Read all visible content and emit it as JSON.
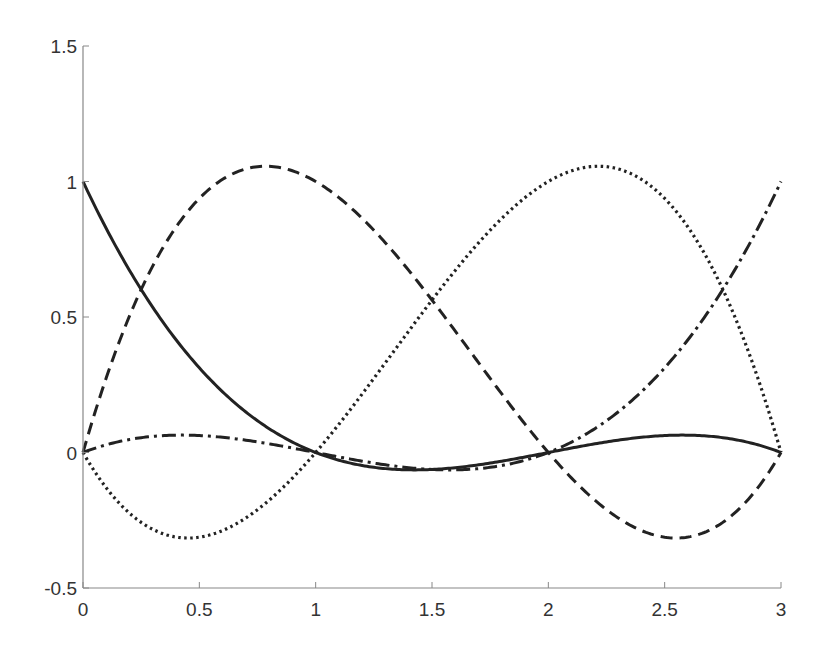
{
  "chart_data": {
    "type": "line",
    "title": "",
    "xlabel": "",
    "ylabel": "",
    "xlim": [
      0,
      3
    ],
    "ylim": [
      -0.5,
      1.5
    ],
    "xticks": [
      0,
      0.5,
      1,
      1.5,
      2,
      2.5,
      3
    ],
    "xtick_labels": [
      "0",
      "0.5",
      "1",
      "1.5",
      "2",
      "2.5",
      "3"
    ],
    "yticks": [
      -0.5,
      0,
      0.5,
      1,
      1.5
    ],
    "ytick_labels": [
      "-0.5",
      "0",
      "0.5",
      "1",
      "1.5"
    ],
    "grid": false,
    "legend": null,
    "box": false,
    "line_color": "#222222",
    "axis_color": "#888888",
    "series": [
      {
        "name": "L0",
        "style": "solid",
        "formula": "-(x-1)(x-2)(x-3)/6",
        "x": [
          0,
          0.25,
          0.5,
          0.75,
          1,
          1.25,
          1.5,
          1.75,
          2,
          2.25,
          2.5,
          2.75,
          3
        ],
        "values": [
          1.0,
          0.602,
          0.3125,
          0.117,
          0.0,
          -0.055,
          -0.0625,
          -0.039,
          0.0,
          0.039,
          0.0625,
          0.055,
          0.0
        ]
      },
      {
        "name": "L1",
        "style": "dashed",
        "formula": "x(x-2)(x-3)/2",
        "x": [
          0,
          0.25,
          0.5,
          0.75,
          1,
          1.25,
          1.5,
          1.75,
          2,
          2.25,
          2.5,
          2.75,
          3
        ],
        "values": [
          0.0,
          0.602,
          0.9375,
          1.055,
          1.0,
          0.82,
          0.5625,
          0.273,
          0.0,
          -0.211,
          -0.3125,
          -0.258,
          0.0
        ]
      },
      {
        "name": "L2",
        "style": "dotted",
        "formula": "-x(x-1)(x-3)/2",
        "x": [
          0,
          0.25,
          0.5,
          0.75,
          1,
          1.25,
          1.5,
          1.75,
          2,
          2.25,
          2.5,
          2.75,
          3
        ],
        "values": [
          0.0,
          -0.258,
          -0.3125,
          -0.211,
          0.0,
          0.273,
          0.5625,
          0.82,
          1.0,
          1.055,
          0.9375,
          0.602,
          0.0
        ]
      },
      {
        "name": "L3",
        "style": "dashdot",
        "formula": "x(x-1)(x-2)/6",
        "x": [
          0,
          0.25,
          0.5,
          0.75,
          1,
          1.25,
          1.5,
          1.75,
          2,
          2.25,
          2.5,
          2.75,
          3
        ],
        "values": [
          0.0,
          0.055,
          0.0625,
          0.039,
          0.0,
          -0.039,
          -0.0625,
          -0.055,
          0.0,
          0.117,
          0.3125,
          0.602,
          1.0
        ]
      }
    ]
  }
}
